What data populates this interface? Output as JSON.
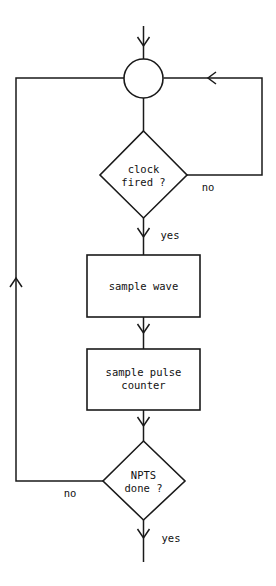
{
  "diagram": {
    "orientation": "top-to-bottom",
    "line_color": "#1a1a1a",
    "fill_color": "#ffffff",
    "background": "#ffffff",
    "nodes": [
      {
        "id": "entry-arrow",
        "type": "arrow",
        "label": ""
      },
      {
        "id": "junction",
        "type": "connector-circle",
        "label": ""
      },
      {
        "id": "clock-decision",
        "type": "decision",
        "label_line_1": "clock",
        "label_line_2": "fired ?"
      },
      {
        "id": "sample-wave",
        "type": "process",
        "label_line_1": "sample wave",
        "label_line_2": ""
      },
      {
        "id": "sample-pulse-counter",
        "type": "process",
        "label_line_1": "sample pulse",
        "label_line_2": "counter"
      },
      {
        "id": "npts-decision",
        "type": "decision",
        "label_line_1": "NPTS",
        "label_line_2": "done ?"
      }
    ],
    "edge_labels": {
      "clock_no": "no",
      "clock_yes": "yes",
      "npts_no": "no",
      "npts_yes": "yes"
    }
  }
}
